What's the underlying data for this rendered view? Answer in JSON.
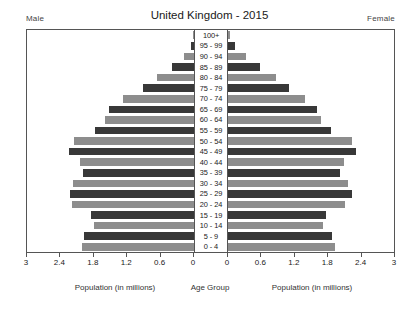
{
  "header": {
    "title": "United Kingdom - 2015",
    "male_label": "Male",
    "female_label": "Female"
  },
  "footer": {
    "left_caption": "Population (in millions)",
    "center_caption": "Age Group",
    "right_caption": "Population (in millions)"
  },
  "axis": {
    "ticks": [
      "3",
      "2.4",
      "1.8",
      "1.2",
      "0.6",
      "0"
    ],
    "tick_values": [
      3,
      2.4,
      1.8,
      1.2,
      0.6,
      0
    ],
    "max": 3
  },
  "colors": {
    "bar_dark": "#383838",
    "bar_light": "#8d8d8d",
    "frame": "#555555",
    "background": "#ffffff"
  },
  "chart_data": {
    "type": "bar",
    "subtype": "population-pyramid",
    "title": "United Kingdom - 2015",
    "xlabel": "Population (in millions)",
    "ylabel": "Age Group",
    "xlim": [
      0,
      3
    ],
    "grid": false,
    "categories": [
      "100+",
      "95 - 99",
      "90 - 94",
      "85 - 89",
      "80 - 84",
      "75 - 79",
      "70 - 74",
      "65 - 69",
      "60 - 64",
      "55 - 59",
      "50 - 54",
      "45 - 49",
      "40 - 44",
      "35 - 39",
      "30 - 34",
      "25 - 29",
      "20 - 24",
      "15 - 19",
      "10 - 14",
      "5 - 9",
      "0 - 4"
    ],
    "series": [
      {
        "name": "Male",
        "side": "left",
        "values": [
          0.01,
          0.06,
          0.18,
          0.39,
          0.66,
          0.92,
          1.27,
          1.52,
          1.6,
          1.77,
          2.15,
          2.25,
          2.05,
          1.99,
          2.18,
          2.23,
          2.19,
          1.85,
          1.79,
          1.97,
          2.02
        ]
      },
      {
        "name": "Female",
        "side": "right",
        "values": [
          0.03,
          0.13,
          0.32,
          0.58,
          0.87,
          1.09,
          1.38,
          1.6,
          1.67,
          1.85,
          2.22,
          2.3,
          2.09,
          2.01,
          2.16,
          2.22,
          2.1,
          1.76,
          1.7,
          1.87,
          1.92
        ]
      }
    ],
    "legend_position": "top-corners"
  }
}
